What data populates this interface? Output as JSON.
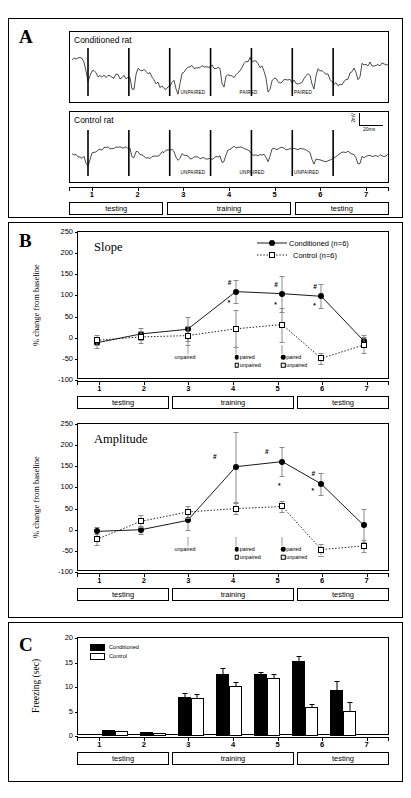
{
  "figure": {
    "panels": [
      "A",
      "B",
      "C"
    ]
  },
  "panelA": {
    "letter": "A",
    "traces": [
      {
        "title": "Conditioned rat",
        "events": [
          {
            "label": "UNPAIRED",
            "x": 0.345
          },
          {
            "label": "PAIRED",
            "x": 0.53
          },
          {
            "label": "PAIRED",
            "x": 0.7
          }
        ]
      },
      {
        "title": "Control rat",
        "events": [
          {
            "label": "UNPAIRED",
            "x": 0.345
          },
          {
            "label": "UNPAIRED",
            "x": 0.53
          },
          {
            "label": "UNPAIRED",
            "x": 0.7
          }
        ]
      }
    ],
    "scalebar": {
      "vertical": "2mV",
      "horizontal": "20ms"
    },
    "ticks": [
      "1",
      "2",
      "3",
      "4",
      "5",
      "6",
      "7"
    ],
    "phases": [
      {
        "label": "testing",
        "start": 0.0,
        "end": 0.295
      },
      {
        "label": "training",
        "start": 0.305,
        "end": 0.695
      },
      {
        "label": "testing",
        "start": 0.705,
        "end": 1.0
      }
    ]
  },
  "panelB": {
    "letter": "B",
    "charts": [
      {
        "title": "Slope",
        "ylabel": "% change from baseline",
        "yticks": [
          250,
          200,
          150,
          100,
          50,
          0,
          -50,
          -100
        ],
        "ylim": [
          -100,
          250
        ],
        "legend": [
          {
            "label": "Conditioned (n=6)",
            "marker": "filled-circle"
          },
          {
            "label": "Control (n=6)",
            "marker": "open-square"
          }
        ],
        "xticks": [
          "1",
          "2",
          "3",
          "4",
          "5",
          "6",
          "7"
        ],
        "annotations": [
          {
            "label": "unpaired",
            "x": 0.425,
            "group": "single"
          },
          {
            "label": "paired",
            "x": 0.585,
            "group": "cond"
          },
          {
            "label": "unpaired",
            "x": 0.585,
            "group": "ctrl"
          },
          {
            "label": "paired",
            "x": 0.745,
            "group": "cond"
          },
          {
            "label": "unpaired",
            "x": 0.745,
            "group": "ctrl"
          }
        ],
        "phases": [
          {
            "label": "testing",
            "start": 0.0,
            "end": 0.295
          },
          {
            "label": "training",
            "start": 0.305,
            "end": 0.695
          },
          {
            "label": "testing",
            "start": 0.705,
            "end": 1.0
          }
        ]
      },
      {
        "title": "Amplitude",
        "ylabel": "% change from baseline",
        "yticks": [
          250,
          200,
          150,
          100,
          50,
          0,
          -50,
          -100
        ],
        "ylim": [
          -100,
          250
        ],
        "xticks": [
          "1",
          "2",
          "3",
          "4",
          "5",
          "6",
          "7"
        ],
        "annotations": [
          {
            "label": "unpaired",
            "x": 0.425,
            "group": "single"
          },
          {
            "label": "paired",
            "x": 0.585,
            "group": "cond"
          },
          {
            "label": "unpaired",
            "x": 0.585,
            "group": "ctrl"
          },
          {
            "label": "paired",
            "x": 0.745,
            "group": "cond"
          },
          {
            "label": "unpaired",
            "x": 0.745,
            "group": "ctrl"
          }
        ],
        "phases": [
          {
            "label": "testing",
            "start": 0.0,
            "end": 0.295
          },
          {
            "label": "training",
            "start": 0.305,
            "end": 0.695
          },
          {
            "label": "testing",
            "start": 0.705,
            "end": 1.0
          }
        ]
      }
    ]
  },
  "panelC": {
    "letter": "C",
    "ylabel": "Freezing (sec)",
    "yticks": [
      20,
      15,
      10,
      5,
      0
    ],
    "ylim": [
      0,
      20
    ],
    "legend": [
      {
        "label": "Conditioned",
        "marker": "filled-bar"
      },
      {
        "label": "Control",
        "marker": "open-bar"
      }
    ],
    "xticks": [
      "1",
      "2",
      "3",
      "4",
      "5",
      "6",
      "7"
    ],
    "phases": [
      {
        "label": "testing",
        "start": 0.0,
        "end": 0.295
      },
      {
        "label": "training",
        "start": 0.305,
        "end": 0.695
      },
      {
        "label": "testing",
        "start": 0.705,
        "end": 1.0
      }
    ]
  },
  "chart_data": [
    {
      "type": "line",
      "title": "Slope",
      "xlabel": "",
      "ylabel": "% change from baseline",
      "ylim": [
        -100,
        250
      ],
      "yticks": [
        250,
        200,
        150,
        100,
        50,
        0,
        -50,
        -100
      ],
      "grid": false,
      "legend_position": "top-right",
      "x": [
        1,
        2.2,
        3.45,
        4.75,
        6.0,
        7.05,
        8.2
      ],
      "xtick_labels": [
        "1",
        "2",
        "3",
        "4",
        "5",
        "6",
        "7"
      ],
      "series": [
        {
          "name": "Conditioned (n=6)",
          "marker": "filled-circle",
          "linestyle": "solid",
          "values": [
            -12,
            9,
            20,
            109,
            104,
            98,
            -8
          ],
          "errors": [
            13,
            15,
            28,
            28,
            43,
            28,
            14
          ]
        },
        {
          "name": "Control (n=6)",
          "marker": "open-square",
          "linestyle": "dotted",
          "values": [
            -6,
            2,
            5,
            21,
            31,
            -49,
            -17
          ],
          "errors": [
            12,
            14,
            22,
            44,
            40,
            13,
            18
          ]
        }
      ],
      "significance": [
        {
          "symbol": "#",
          "x": 4.75,
          "y": 128
        },
        {
          "symbol": "*",
          "x": 4.75,
          "y": 79
        },
        {
          "symbol": "#",
          "x": 6.0,
          "y": 122
        },
        {
          "symbol": "*",
          "x": 6.0,
          "y": 74
        },
        {
          "symbol": "#",
          "x": 7.05,
          "y": 117
        },
        {
          "symbol": "*",
          "x": 7.05,
          "y": 72
        }
      ],
      "annotations": [
        "unpaired",
        "paired",
        "unpaired",
        "paired",
        "unpaired"
      ]
    },
    {
      "type": "line",
      "title": "Amplitude",
      "xlabel": "",
      "ylabel": "% change from baseline",
      "ylim": [
        -100,
        250
      ],
      "yticks": [
        250,
        200,
        150,
        100,
        50,
        0,
        -50,
        -100
      ],
      "grid": false,
      "legend_position": "none",
      "x": [
        1,
        2.2,
        3.45,
        4.75,
        6.0,
        7.05,
        8.2
      ],
      "xtick_labels": [
        "1",
        "2",
        "3",
        "4",
        "5",
        "6",
        "7"
      ],
      "series": [
        {
          "name": "Conditioned (n=6)",
          "marker": "filled-circle",
          "linestyle": "solid",
          "values": [
            -4,
            0,
            22,
            149,
            161,
            108,
            10
          ],
          "errors": [
            11,
            9,
            22,
            83,
            35,
            25,
            40
          ]
        },
        {
          "name": "Control (n=6)",
          "marker": "open-square",
          "linestyle": "dotted",
          "values": [
            -23,
            20,
            42,
            50,
            55,
            -47,
            -38
          ]
        }
      ],
      "significance": [
        {
          "symbol": "#",
          "x": 4.35,
          "y": 170
        },
        {
          "symbol": "#",
          "x": 5.75,
          "y": 181
        },
        {
          "symbol": "#",
          "x": 7.0,
          "y": 130
        },
        {
          "symbol": "*",
          "x": 6.1,
          "y": 100
        },
        {
          "symbol": "*",
          "x": 7.0,
          "y": 90
        }
      ],
      "annotations": [
        "unpaired",
        "paired",
        "unpaired",
        "paired",
        "unpaired"
      ]
    },
    {
      "type": "bar",
      "title": "",
      "xlabel": "",
      "ylabel": "Freezing (sec)",
      "ylim": [
        0,
        20
      ],
      "yticks": [
        20,
        15,
        10,
        5,
        0
      ],
      "grid": false,
      "legend_position": "top-left",
      "categories": [
        "1",
        "2",
        "3",
        "4",
        "5",
        "6",
        "7"
      ],
      "series": [
        {
          "name": "Conditioned",
          "values": [
            1.3,
            0.8,
            8.0,
            12.6,
            12.6,
            15.4,
            9.3
          ],
          "errors": [
            0.0,
            0.0,
            0.8,
            1.2,
            0.5,
            0.9,
            2.0
          ]
        },
        {
          "name": "Control",
          "values": [
            1.0,
            0.6,
            7.7,
            10.2,
            11.8,
            6.0,
            5.2
          ],
          "errors": [
            0.0,
            0.0,
            0.9,
            0.9,
            0.9,
            0.6,
            1.8
          ]
        }
      ]
    }
  ]
}
